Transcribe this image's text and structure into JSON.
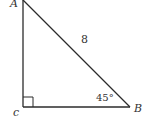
{
  "diagram": {
    "type": "right-triangle",
    "vertices": {
      "A": {
        "label": "A"
      },
      "B": {
        "label": "B"
      },
      "C": {
        "label": "c"
      }
    },
    "hypotenuse_label": "8",
    "angle_B_label": "45°",
    "right_angle_at": "C",
    "colors": {
      "stroke": "#2b2b2b",
      "text": "#333333",
      "background": "#ffffff"
    }
  }
}
